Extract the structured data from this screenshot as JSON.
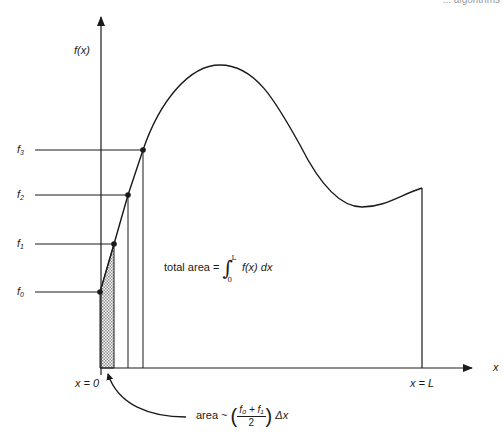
{
  "header": {
    "cropped_text": "... algorithms"
  },
  "axes": {
    "y_label": "f(x)",
    "x_label": "x",
    "x_start_label": "x = 0",
    "x_end_label": "x = L"
  },
  "samples": [
    {
      "label": "f",
      "sub": "0"
    },
    {
      "label": "f",
      "sub": "1"
    },
    {
      "label": "f",
      "sub": "2"
    },
    {
      "label": "f",
      "sub": "3"
    }
  ],
  "annotations": {
    "total_area_prefix": "total area =",
    "total_area_integrand": "f(x) dx",
    "integral_lower": "0",
    "integral_upper": "L",
    "trap_prefix": "area ~",
    "trap_numerator": "f₀ + f₁",
    "trap_denominator": "2",
    "trap_suffix": "Δx"
  },
  "colors": {
    "ink": "#1a1a1a",
    "hatch": "#bdbdbd"
  }
}
